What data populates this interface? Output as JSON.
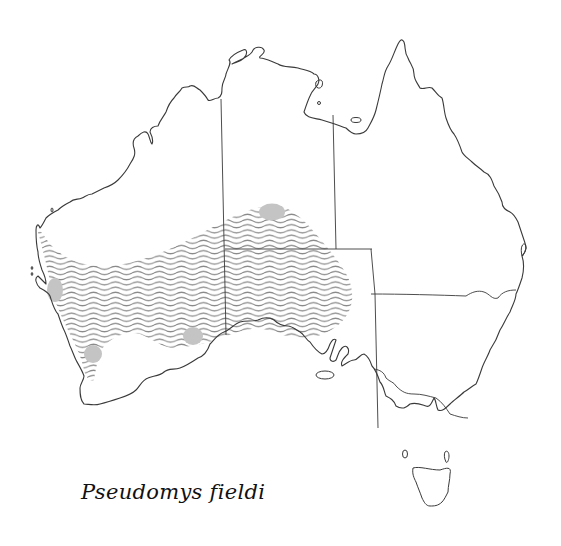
{
  "map": {
    "title": "Pseudomys fieldi",
    "region": "Australia",
    "species_label": "Pseudomys fieldi",
    "style": {
      "coast_color": "#3a3a3a",
      "range_hatch_color": "#8a8a8a",
      "spot_color": "#c4c4c4",
      "background": "#ffffff"
    },
    "legend": {
      "hatched_area": "distribution range",
      "grey_spots": "localities"
    },
    "spots": [
      {
        "name": "spot-central-north",
        "cx": 272,
        "cy": 212,
        "rx": 13,
        "ry": 9
      },
      {
        "name": "spot-west-coast",
        "cx": 55,
        "cy": 288,
        "rx": 8,
        "ry": 12
      },
      {
        "name": "spot-southwest",
        "cx": 93,
        "cy": 354,
        "rx": 9,
        "ry": 9
      },
      {
        "name": "spot-south-central",
        "cx": 193,
        "cy": 337,
        "rx": 10,
        "ry": 9
      }
    ]
  }
}
